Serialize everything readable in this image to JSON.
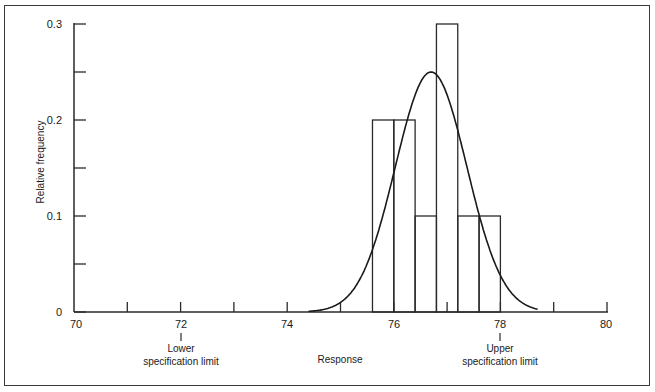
{
  "chart_data": {
    "type": "bar",
    "subtype": "histogram-with-normal-curve",
    "title": "",
    "xlabel": "Response",
    "ylabel": "Relative frequency",
    "xlim": [
      70,
      80
    ],
    "ylim": [
      0,
      0.3
    ],
    "x_ticks": [
      70,
      72,
      74,
      76,
      78,
      80
    ],
    "x_minor_ticks": [
      71,
      73,
      75,
      77,
      79
    ],
    "y_ticks": [
      0,
      0.1,
      0.2,
      0.3
    ],
    "y_minor_ticks": [
      0.05,
      0.15,
      0.25
    ],
    "bin_width": 0.4,
    "bins": [
      {
        "from": 75.6,
        "to": 76.0,
        "value": 0.2
      },
      {
        "from": 76.0,
        "to": 76.4,
        "value": 0.2
      },
      {
        "from": 76.4,
        "to": 76.8,
        "value": 0.1
      },
      {
        "from": 76.8,
        "to": 77.2,
        "value": 0.3
      },
      {
        "from": 77.2,
        "to": 77.6,
        "value": 0.1
      },
      {
        "from": 77.6,
        "to": 78.0,
        "value": 0.1
      }
    ],
    "categories": [
      "75.6-76.0",
      "76.0-76.4",
      "76.4-76.8",
      "76.8-77.2",
      "77.2-77.6",
      "77.6-78.0"
    ],
    "values": [
      0.2,
      0.2,
      0.1,
      0.3,
      0.1,
      0.1
    ],
    "fitted_curve": {
      "type": "normal",
      "mean": 76.7,
      "sd": 0.67,
      "peak_height": 0.25
    },
    "annotations": [
      {
        "x": 72,
        "text_line1": "Lower",
        "text_line2": "specification limit"
      },
      {
        "x": 78,
        "text_line1": "Upper",
        "text_line2": "specification limit"
      }
    ],
    "grid": false,
    "legend": null
  },
  "labels": {
    "y_axis": "Relative frequency",
    "x_axis": "Response",
    "y_tick_0": "0",
    "y_tick_1": "0.1",
    "y_tick_2": "0.2",
    "y_tick_3": "0.3",
    "x_tick_70": "70",
    "x_tick_72": "72",
    "x_tick_74": "74",
    "x_tick_76": "76",
    "x_tick_78": "78",
    "x_tick_80": "80",
    "lsl_line1": "Lower",
    "lsl_line2": "specification limit",
    "usl_line1": "Upper",
    "usl_line2": "specification limit"
  }
}
